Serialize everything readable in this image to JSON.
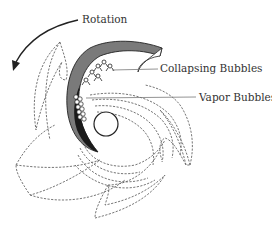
{
  "figure": {
    "labels": {
      "rotation": "Rotation",
      "collapsing_bubbles": "Collapsing Bubbles",
      "vapor_bubbles": "Vapor Bubbles"
    },
    "colors": {
      "blade_fill": "#7a7a7a",
      "blade_dark": "#1a1a1a",
      "outline": "#555555",
      "text": "#333333",
      "background": "#ffffff"
    },
    "elements": [
      "rotation-arrow",
      "highlighted-impeller-blade",
      "dashed-impeller-blades",
      "hub-eye-circle",
      "collapsing-bubble-cluster",
      "vapor-bubble-cluster",
      "flow-streamlines"
    ]
  }
}
